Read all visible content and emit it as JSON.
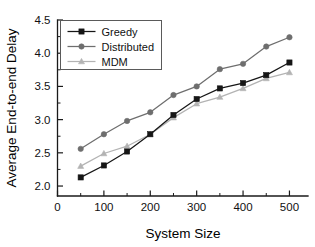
{
  "chart_data": {
    "type": "line",
    "title": "",
    "subtitle": "",
    "xlabel": "System Size",
    "ylabel": "Average End-to-end Delay",
    "x": [
      50,
      100,
      150,
      200,
      250,
      300,
      350,
      400,
      450,
      500
    ],
    "xlim": [
      0,
      540
    ],
    "ylim": [
      1.85,
      4.5
    ],
    "grid": false,
    "legend_position": "top-left",
    "x_ticks_major": [
      0,
      100,
      200,
      300,
      400,
      500
    ],
    "x_ticks_minor": [
      50,
      150,
      250,
      350,
      450
    ],
    "x_tick_labels": [
      "0",
      "100",
      "200",
      "300",
      "400",
      "500"
    ],
    "y_ticks_major": [
      2.0,
      2.5,
      3.0,
      3.5,
      4.0,
      4.5
    ],
    "y_ticks_minor": [
      2.25,
      2.75,
      3.25,
      3.75,
      4.25
    ],
    "y_tick_labels": [
      "2.0",
      "2.5",
      "3.0",
      "3.5",
      "4.0",
      "4.5"
    ],
    "series": [
      {
        "name": "Greedy",
        "marker": "square",
        "color": "#161616",
        "values": [
          2.13,
          2.31,
          2.52,
          2.78,
          3.07,
          3.31,
          3.47,
          3.55,
          3.67,
          3.86
        ]
      },
      {
        "name": "Distributed",
        "marker": "circle",
        "color": "#6e6e6e",
        "values": [
          2.56,
          2.78,
          2.98,
          3.11,
          3.37,
          3.5,
          3.76,
          3.84,
          4.1,
          4.24
        ]
      },
      {
        "name": "MDM",
        "marker": "triangle",
        "color": "#b3b3b3",
        "values": [
          2.3,
          2.49,
          2.6,
          2.78,
          3.03,
          3.24,
          3.34,
          3.47,
          3.62,
          3.71
        ]
      }
    ]
  },
  "legend": {
    "entries": [
      {
        "label": "Greedy"
      },
      {
        "label": "Distributed"
      },
      {
        "label": "MDM"
      }
    ]
  },
  "axes": {
    "x_title": "System Size",
    "y_title": "Average End-to-end Delay"
  }
}
